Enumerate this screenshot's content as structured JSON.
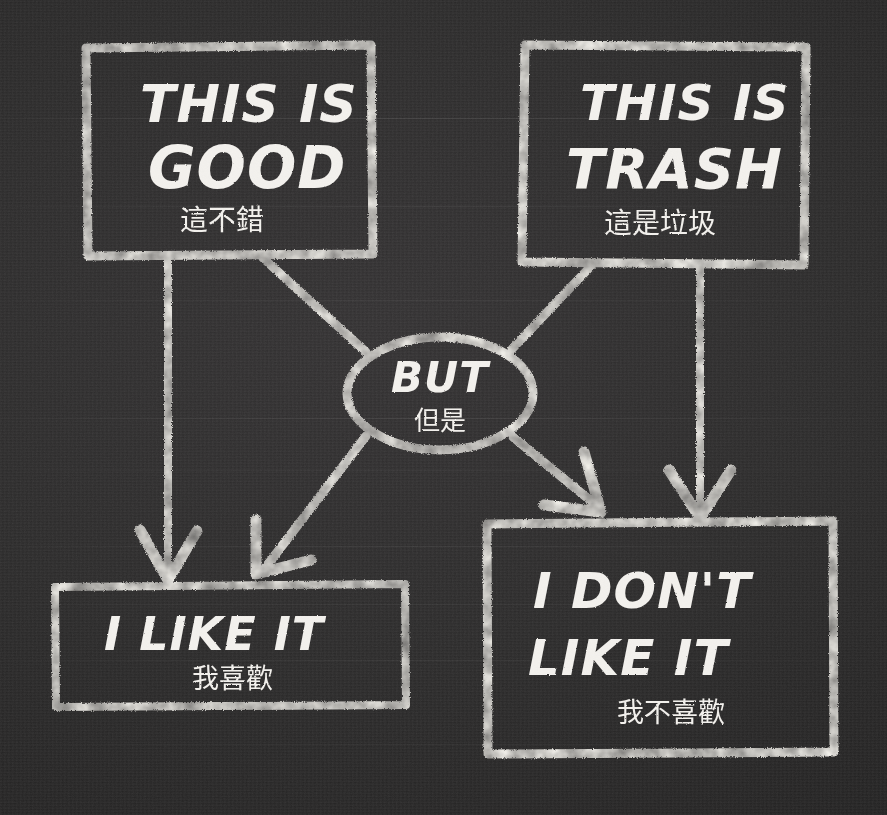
{
  "canvas": {
    "width": 887,
    "height": 815,
    "background_color": "#2a2a2a",
    "chalk_color": "#f4f2ee",
    "medium": "chalk on blackboard"
  },
  "diagram": {
    "type": "flowchart",
    "title_visible": false,
    "nodes": [
      {
        "id": "good",
        "shape": "rectangle",
        "label_en": "THIS IS\nGOOD",
        "label_en_line1": "THIS IS",
        "label_en_line2": "GOOD",
        "label_zh": "這不錯",
        "position": "top-left"
      },
      {
        "id": "trash",
        "shape": "rectangle",
        "label_en_line1": "THIS IS",
        "label_en_line2": "TRASH",
        "label_zh": "這是垃圾",
        "position": "top-right"
      },
      {
        "id": "but",
        "shape": "ellipse",
        "label_en_line1": "BUT",
        "label_zh": "但是",
        "position": "center"
      },
      {
        "id": "like",
        "shape": "rectangle",
        "label_en_line1": "I LIKE IT",
        "label_zh": "我喜歡",
        "position": "bottom-left"
      },
      {
        "id": "dontlike",
        "shape": "rectangle",
        "label_en_line1": "I DON'T",
        "label_en_line2": "LIKE IT",
        "label_zh": "我不喜歡",
        "position": "bottom-right"
      }
    ],
    "edges": [
      {
        "id": "good-to-like",
        "from": "good",
        "to": "like",
        "style": "straight-vertical",
        "arrowhead": true
      },
      {
        "id": "good-to-but",
        "from": "good",
        "to": "but",
        "style": "diagonal",
        "arrowhead": false
      },
      {
        "id": "trash-to-dontlike",
        "from": "trash",
        "to": "dontlike",
        "style": "straight-vertical",
        "arrowhead": true
      },
      {
        "id": "trash-to-but",
        "from": "trash",
        "to": "but",
        "style": "diagonal",
        "arrowhead": false
      },
      {
        "id": "but-to-like",
        "from": "but",
        "to": "like",
        "style": "diagonal",
        "arrowhead": true
      },
      {
        "id": "but-to-dontlike",
        "from": "but",
        "to": "dontlike",
        "style": "diagonal",
        "arrowhead": true
      }
    ]
  }
}
